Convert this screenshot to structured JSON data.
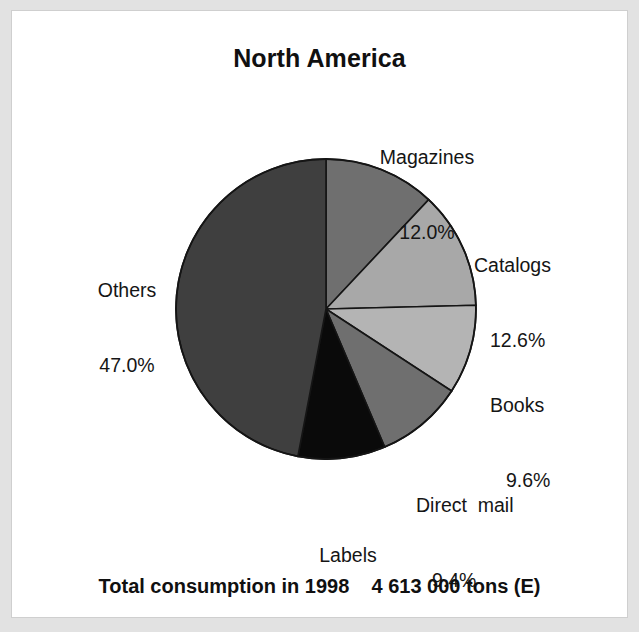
{
  "figure": {
    "title": "North America",
    "caption": "Total consumption in 1998    4 613 000 tons (E)",
    "background_color": "#ffffff",
    "frame_color": "#e2e2e2"
  },
  "chart_data": {
    "type": "pie",
    "title": "North America",
    "subtitle": "Total consumption in 1998    4 613 000 tons (E)",
    "unit": "%",
    "total_label": "Total consumption in 1998",
    "total_value": "4 613 000 tons (E)",
    "year": "1998",
    "start_angle_deg": 0,
    "direction": "clockwise",
    "legend": "none (direct labels)",
    "grid": false,
    "categories": [
      "Magazines",
      "Catalogs",
      "Books",
      "Direct  mail",
      "Labels",
      "Others"
    ],
    "values": [
      12.0,
      12.6,
      9.6,
      9.4,
      9.4,
      47.0
    ],
    "slices": [
      {
        "label": "Magazines",
        "value": 12.0,
        "value_text": "12.0%",
        "color": "#6f6f6f"
      },
      {
        "label": "Catalogs",
        "value": 12.6,
        "value_text": "12.6%",
        "color": "#a8a8a8"
      },
      {
        "label": "Books",
        "value": 9.6,
        "value_text": "9.6%",
        "color": "#b4b4b4"
      },
      {
        "label": "Direct  mail",
        "value": 9.4,
        "value_text": "9.4%",
        "color": "#6f6f6f"
      },
      {
        "label": "Labels",
        "value": 9.4,
        "value_text": "9.4%",
        "color": "#0a0a0a"
      },
      {
        "label": "Others",
        "value": 47.0,
        "value_text": "47.0%",
        "color": "#3f3f3f"
      }
    ],
    "geometry": {
      "center_x": 325,
      "center_y": 308,
      "radius": 150
    }
  }
}
